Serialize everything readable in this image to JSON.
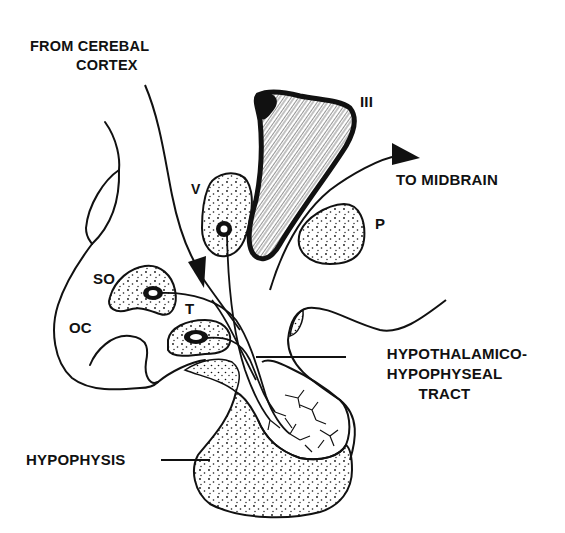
{
  "diagram": {
    "colors": {
      "ink": "#111111",
      "background": "#ffffff"
    },
    "labels": {
      "from_cerebral_cortex_line1": "FROM CEREBAL",
      "from_cerebral_cortex_line2": "CORTEX",
      "third_ventricle": "III",
      "to_midbrain": "TO MIDBRAIN",
      "paraventricular": "V",
      "posterior": "P",
      "supraoptic": "SO",
      "optic_chiasm": "OC",
      "tuberal": "T",
      "tract_line1": "HYPOTHALAMICO-",
      "tract_line2": "HYPOPHYSEAL",
      "tract_line3": "TRACT",
      "hypophysis": "HYPOPHYSIS"
    }
  }
}
